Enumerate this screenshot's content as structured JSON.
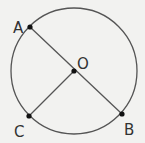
{
  "diagram": {
    "type": "circle-geometry",
    "colors": {
      "background": "#f2f2f0",
      "stroke": "#555555",
      "point": "#111111",
      "label": "#333333"
    },
    "circle": {
      "center": "O",
      "cx": 74,
      "cy": 71,
      "r": 63
    },
    "points": [
      {
        "id": "A",
        "label": "A",
        "x": 30,
        "y": 27,
        "lx": 15,
        "ly": 27
      },
      {
        "id": "B",
        "label": "B",
        "x": 122,
        "y": 114,
        "lx": 124,
        "ly": 134
      },
      {
        "id": "C",
        "label": "C",
        "x": 29,
        "y": 116,
        "lx": 14,
        "ly": 136
      },
      {
        "id": "O",
        "label": "O",
        "x": 74,
        "y": 71,
        "lx": 78,
        "ly": 70
      }
    ],
    "segments": [
      {
        "name": "diameter-AB",
        "from": "A",
        "to": "B"
      },
      {
        "name": "radius-OC",
        "from": "O",
        "to": "C"
      }
    ]
  }
}
